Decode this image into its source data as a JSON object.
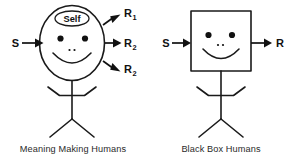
{
  "figure": {
    "type": "diagram",
    "background_color": "#ffffff",
    "ink_color": "#1a1a1a",
    "panels": [
      {
        "id": "meaning-making-humans",
        "caption": "Meaning Making Humans",
        "head_shape": "circle",
        "inner_label": "Self",
        "inputs": [
          {
            "label": "S",
            "direction": "right"
          }
        ],
        "outputs": [
          {
            "label": "R",
            "subscript": "1",
            "direction": "up-right"
          },
          {
            "label": "R",
            "subscript": "2",
            "direction": "right"
          },
          {
            "label": "R",
            "subscript": "2",
            "direction": "down-right"
          }
        ],
        "face": {
          "eyes": 2,
          "nose_dots": 2,
          "mouth": "smile"
        }
      },
      {
        "id": "black-box-humans",
        "caption": "Black Box Humans",
        "head_shape": "square",
        "inner_label": "",
        "inputs": [
          {
            "label": "S",
            "direction": "right"
          }
        ],
        "outputs": [
          {
            "label": "R",
            "subscript": "",
            "direction": "right"
          }
        ],
        "face": {
          "eyes": 2,
          "nose_dots": 2,
          "mouth": "smile"
        }
      }
    ]
  },
  "left": {
    "stimulus_label": "S",
    "self_label": "Self",
    "response_1": "R",
    "response_1_sub": "1",
    "response_2": "R",
    "response_2_sub": "2",
    "response_3": "R",
    "response_3_sub": "2",
    "caption": "Meaning Making Humans"
  },
  "right": {
    "stimulus_label": "S",
    "response_label": "R",
    "caption": "Black Box Humans"
  }
}
